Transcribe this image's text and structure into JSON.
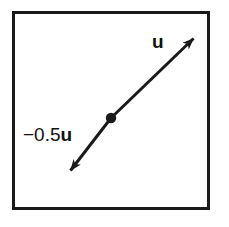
{
  "figure": {
    "name": "vector-scalar-multiple-diagram",
    "colors": {
      "stroke": "#1a1a1a",
      "frame": "#1a1a1a",
      "background": "#ffffff",
      "text": "#111111"
    },
    "frame": {
      "visible": true,
      "border_width_px": 3
    },
    "labels": {
      "positive_vector": "u",
      "negative_vector_prefix": "−0.5",
      "negative_vector_symbol": "u",
      "negative_vector_full": "−0.5u"
    },
    "geometry": {
      "origin_point": {
        "x": 111,
        "y": 118
      },
      "positive_arrow_tip": {
        "x": 196,
        "y": 36
      },
      "negative_arrow_tip": {
        "x": 68,
        "y": 173
      },
      "line_width_px": 3,
      "dot_radius_px": 5
    }
  }
}
